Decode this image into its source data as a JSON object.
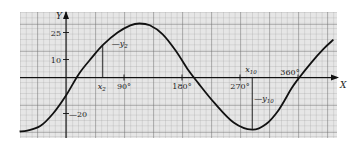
{
  "chart_data": {
    "type": "line",
    "title": "",
    "xlabel": "X",
    "ylabel": "Y",
    "xlim": [
      -80,
      415
    ],
    "ylim": [
      -33,
      37
    ],
    "grid": true,
    "x_ticks": [
      {
        "value": 90,
        "label": "90°"
      },
      {
        "value": 180,
        "label": "180°"
      },
      {
        "value": 270,
        "label": "270°"
      },
      {
        "value": 360,
        "label": "360°"
      }
    ],
    "y_ticks": [
      {
        "value": 25,
        "label": "25"
      },
      {
        "value": 10,
        "label": "10"
      },
      {
        "value": -20,
        "label": "-20"
      }
    ],
    "annotations": [
      {
        "label": "x2",
        "x": 57,
        "note": "vertical ordinate line up to curve"
      },
      {
        "label": "y2",
        "x": 57,
        "y": 18
      },
      {
        "label": "x10",
        "x": 289
      },
      {
        "label": "y10",
        "x": 289,
        "y": -29
      }
    ],
    "series": [
      {
        "name": "curve",
        "x": [
          -72,
          -60,
          -40,
          -20,
          0,
          20,
          40,
          57,
          80,
          100,
          114,
          130,
          150,
          170,
          190,
          205,
          230,
          260,
          289,
          310,
          330,
          350,
          360,
          380,
          400,
          415
        ],
        "y": [
          -30,
          -29.5,
          -27,
          -20,
          -10,
          2,
          11,
          18,
          25,
          29,
          30,
          29,
          24,
          15,
          4,
          -3,
          -14,
          -25,
          -29,
          -26,
          -18,
          -6,
          -1,
          8,
          16,
          21
        ]
      }
    ]
  },
  "labels": {
    "y_axis": "Y",
    "x_axis": "X",
    "x2": "x",
    "x2_sub": "2",
    "y2": "y",
    "y2_sub": "2",
    "x10": "x",
    "x10_sub": "10",
    "y10": "y",
    "y10_sub": "10"
  }
}
